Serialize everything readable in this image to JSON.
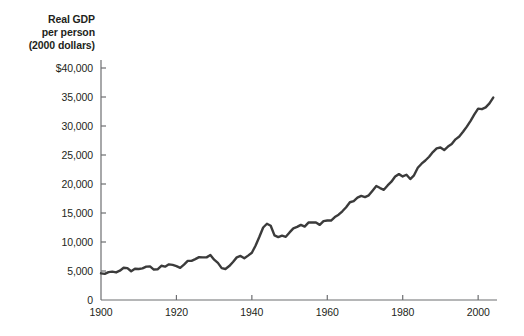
{
  "chart_data": {
    "type": "line",
    "title": "Real GDP\nper person\n(2000 dollars)",
    "title_lines": [
      "Real GDP",
      "per person",
      "(2000 dollars)"
    ],
    "xlabel": "",
    "ylabel": "Real GDP per person (2000 dollars)",
    "xlim": [
      1900,
      2005
    ],
    "ylim": [
      0,
      40000
    ],
    "grid": false,
    "legend": "none",
    "line_color": "#3b3b3b",
    "axis_color": "#6d6e71",
    "text_color": "#231f20",
    "yticks": [
      0,
      5000,
      10000,
      15000,
      20000,
      25000,
      30000,
      35000,
      40000
    ],
    "ytick_labels": [
      "0",
      "5,000",
      "10,000",
      "15,000",
      "20,000",
      "25,000",
      "30,000",
      "35,000",
      "$40,000"
    ],
    "xticks": [
      1900,
      1920,
      1940,
      1960,
      1980,
      2000
    ],
    "xtick_labels": [
      "1900",
      "1920",
      "1940",
      "1960",
      "1980",
      "2000"
    ],
    "series_name": "Real GDP per person",
    "x": [
      1900,
      1901,
      1902,
      1903,
      1904,
      1905,
      1906,
      1907,
      1908,
      1909,
      1910,
      1911,
      1912,
      1913,
      1914,
      1915,
      1916,
      1917,
      1918,
      1919,
      1920,
      1921,
      1922,
      1923,
      1924,
      1925,
      1926,
      1927,
      1928,
      1929,
      1930,
      1931,
      1932,
      1933,
      1934,
      1935,
      1936,
      1937,
      1938,
      1939,
      1940,
      1941,
      1942,
      1943,
      1944,
      1945,
      1946,
      1947,
      1948,
      1949,
      1950,
      1951,
      1952,
      1953,
      1954,
      1955,
      1956,
      1957,
      1958,
      1959,
      1960,
      1961,
      1962,
      1963,
      1964,
      1965,
      1966,
      1967,
      1968,
      1969,
      1970,
      1971,
      1972,
      1973,
      1974,
      1975,
      1976,
      1977,
      1978,
      1979,
      1980,
      1981,
      1982,
      1983,
      1984,
      1985,
      1986,
      1987,
      1988,
      1989,
      1990,
      1991,
      1992,
      1993,
      1994,
      1995,
      1996,
      1997,
      1998,
      1999,
      2000,
      2001,
      2002,
      2003,
      2004
    ],
    "values": [
      4600,
      4500,
      4800,
      4900,
      4750,
      5050,
      5550,
      5500,
      4950,
      5400,
      5350,
      5450,
      5750,
      5800,
      5250,
      5300,
      5900,
      5750,
      6150,
      6050,
      5850,
      5550,
      6100,
      6750,
      6750,
      7050,
      7400,
      7350,
      7350,
      7750,
      6950,
      6400,
      5500,
      5350,
      5850,
      6550,
      7350,
      7600,
      7200,
      7650,
      8150,
      9400,
      10900,
      12500,
      13150,
      12800,
      11150,
      10850,
      11100,
      10900,
      11650,
      12350,
      12600,
      12950,
      12650,
      13350,
      13350,
      13350,
      12950,
      13600,
      13700,
      13700,
      14300,
      14700,
      15300,
      16000,
      16850,
      17050,
      17650,
      17950,
      17750,
      18050,
      18850,
      19650,
      19300,
      19000,
      19750,
      20400,
      21300,
      21700,
      21300,
      21600,
      20850,
      21500,
      22800,
      23500,
      24050,
      24700,
      25500,
      26150,
      26300,
      25850,
      26450,
      26900,
      27700,
      28200,
      29000,
      29900,
      30900,
      32000,
      33000,
      32900,
      33200,
      33900,
      34900
    ]
  },
  "plot_geometry": {
    "left_px": 101,
    "right_px": 497,
    "baseline_px": 300,
    "top_value_px": 68
  }
}
